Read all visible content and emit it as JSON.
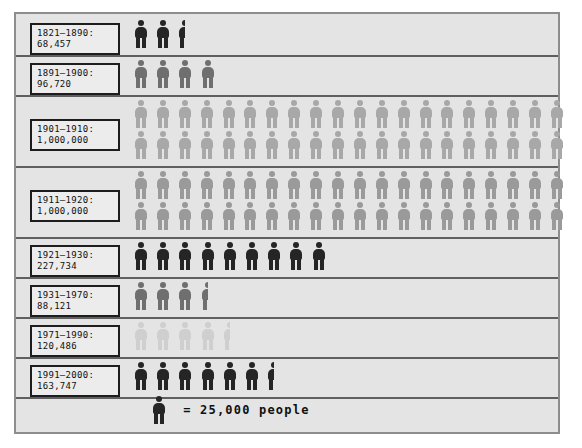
{
  "chart_data": {
    "type": "pictogram",
    "title": "",
    "unit_value": 25000,
    "legend_label": "= 25,000 people",
    "legend_icon": "person-icon",
    "xlabel": "",
    "ylabel": "",
    "categories": [
      "1821–1890",
      "1891–1900",
      "1901–1910",
      "1911–1920",
      "1921–1930",
      "1931–1970",
      "1971–1990",
      "1991–2000"
    ],
    "values": [
      68457,
      96720,
      1000000,
      1000000,
      227734,
      88121,
      120486,
      163747
    ],
    "rows": [
      {
        "period": "1821–1890",
        "value_text": "68,457",
        "label": "1821–1890:\n68,457",
        "value": 68457,
        "full_icons": 2,
        "half_icons": 1,
        "icon_rows": 1,
        "tone": "tone-black",
        "color": "#252525"
      },
      {
        "period": "1891–1900",
        "value_text": "96,720",
        "label": "1891–1900:\n96,720",
        "value": 96720,
        "full_icons": 4,
        "half_icons": 0,
        "icon_rows": 1,
        "tone": "tone-dark",
        "color": "#6f6f6f"
      },
      {
        "period": "1901–1910",
        "value_text": "1,000,000",
        "label": "1901–1910:\n1,000,000",
        "value": 1000000,
        "full_icons": 40,
        "half_icons": 0,
        "icon_rows": 2,
        "tone": "tone-mid",
        "color": "#a8a8a8"
      },
      {
        "period": "1911–1920",
        "value_text": "1,000,000",
        "label": "1911–1920:\n1,000,000",
        "value": 1000000,
        "full_icons": 40,
        "half_icons": 0,
        "icon_rows": 2,
        "tone": "tone-midlight",
        "color": "#9a9a9a"
      },
      {
        "period": "1921–1930",
        "value_text": "227,734",
        "label": "1921–1930:\n227,734",
        "value": 227734,
        "full_icons": 9,
        "half_icons": 0,
        "icon_rows": 1,
        "tone": "tone-black",
        "color": "#252525"
      },
      {
        "period": "1931–1970",
        "value_text": "88,121",
        "label": "1931–1970:\n88,121",
        "value": 88121,
        "full_icons": 3,
        "half_icons": 1,
        "icon_rows": 1,
        "tone": "tone-dark",
        "color": "#6f6f6f"
      },
      {
        "period": "1971–1990",
        "value_text": "120,486",
        "label": "1971–1990:\n120,486",
        "value": 120486,
        "full_icons": 4,
        "half_icons": 1,
        "icon_rows": 1,
        "tone": "tone-light",
        "color": "#cfcfcf"
      },
      {
        "period": "1991–2000",
        "value_text": "163,747",
        "label": "1991–2000:\n163,747",
        "value": 163747,
        "full_icons": 6,
        "half_icons": 1,
        "icon_rows": 1,
        "tone": "tone-black",
        "color": "#252525"
      }
    ],
    "icons_per_row": 20,
    "background_color": "#e4e4e4",
    "frame_border_color": "#8d8d8d",
    "label_border_color": "#1d1d1d",
    "rule_color": "#5f5f5f"
  }
}
